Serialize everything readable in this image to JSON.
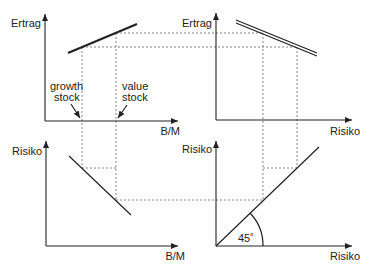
{
  "panels": {
    "top_left": {
      "y_label": "Ertrag",
      "x_label": "B/M",
      "annotation_growth_line1": "growth",
      "annotation_growth_line2": "stock",
      "annotation_value_line1": "value",
      "annotation_value_line2": "stock"
    },
    "top_right": {
      "y_label": "Ertrag",
      "x_label": "Risiko"
    },
    "bottom_left": {
      "y_label": "Risiko",
      "x_label": "B/M"
    },
    "bottom_right": {
      "y_label": "Risiko",
      "x_label": "Risiko",
      "angle_label": "45˚"
    }
  },
  "colors": {
    "lines": "#222222",
    "dashed": "#666666",
    "background": "#ffffff"
  }
}
